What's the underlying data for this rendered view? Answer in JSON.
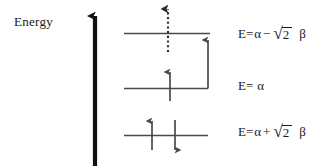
{
  "figure": {
    "type": "molecular-orbital-energy-level-diagram",
    "background_color": "#ffffff",
    "line_color": "#4a4a4a",
    "axis_color": "#111111",
    "text_color": "#1a1a1a"
  },
  "axis": {
    "label": "Energy",
    "direction": "up",
    "arrow_x": 95,
    "top_y": 13,
    "bottom_y": 166
  },
  "levels": [
    {
      "id": "antibonding",
      "name": "antibonding-level",
      "y": 33,
      "x_start": 124,
      "x_end": 210,
      "energy_label": {
        "lhs": "E=",
        "alpha": "α",
        "operator": "−",
        "radical_sign": "√",
        "radicand": "2",
        "beta": "β",
        "full_text": "E= α − √2 β"
      },
      "electrons": [],
      "transition_arrows": [
        "dotted-excitation-arrow",
        "solid-excitation-arrow"
      ]
    },
    {
      "id": "nonbonding",
      "name": "nonbonding-level",
      "y": 88,
      "x_start": 124,
      "x_end": 208,
      "energy_label": {
        "lhs": "E=",
        "alpha": "α",
        "operator": "",
        "radical_sign": "",
        "radicand": "",
        "beta": "",
        "full_text": "E= α"
      },
      "electrons": [
        {
          "name": "electron-spin-up",
          "x": 170,
          "spin": "up"
        }
      ],
      "transition_arrows": []
    },
    {
      "id": "bonding",
      "name": "bonding-level",
      "y": 135,
      "x_start": 124,
      "x_end": 208,
      "energy_label": {
        "lhs": "E=",
        "alpha": "α",
        "operator": "+",
        "radical_sign": "√",
        "radicand": "2",
        "beta": "β",
        "full_text": "E= α + √2 β"
      },
      "electrons": [
        {
          "name": "electron-spin-up",
          "x": 152,
          "spin": "up"
        },
        {
          "name": "electron-spin-down",
          "x": 175,
          "spin": "down"
        }
      ],
      "transition_arrows": []
    }
  ],
  "arrows": {
    "dotted_excitation": {
      "name": "dotted-excitation-arrow",
      "x": 168,
      "from_y": 52,
      "to_y": 3,
      "style": "dotted",
      "head": "up"
    },
    "solid_excitation": {
      "name": "solid-excitation-arrow",
      "x": 208,
      "from_y": 88,
      "to_y": 34,
      "style": "solid",
      "head": "up"
    }
  },
  "equation_positions": [
    {
      "level": "antibonding",
      "left": 238,
      "top": 27
    },
    {
      "level": "nonbonding",
      "left": 238,
      "top": 79
    },
    {
      "level": "bonding",
      "left": 238,
      "top": 125
    }
  ]
}
